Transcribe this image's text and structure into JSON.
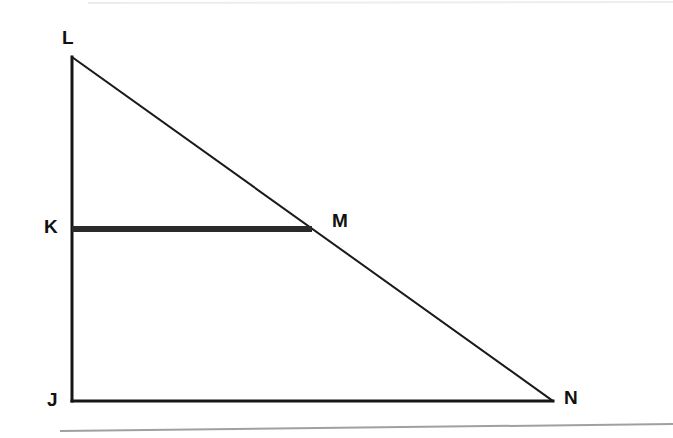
{
  "figure": {
    "type": "geometry-diagram",
    "shape": "right-triangle-with-parallel-segment",
    "background_color": "#ffffff",
    "stroke_color": "#161616",
    "labels": {
      "L": "L",
      "K": "K",
      "M": "M",
      "J": "J",
      "N": "N"
    },
    "points": {
      "L": {
        "x": 72,
        "y": 57
      },
      "K": {
        "x": 72,
        "y": 229
      },
      "M": {
        "x": 312,
        "y": 229
      },
      "J": {
        "x": 72,
        "y": 401
      },
      "N": {
        "x": 553,
        "y": 401
      }
    },
    "segments": [
      {
        "name": "JL",
        "from": "L",
        "to": "J",
        "width": 3,
        "emphasis": "normal"
      },
      {
        "name": "JN",
        "from": "J",
        "to": "N",
        "width": 3,
        "emphasis": "normal"
      },
      {
        "name": "LN",
        "from": "L",
        "to": "N",
        "width": 2,
        "emphasis": "thin"
      },
      {
        "name": "KM",
        "from": "K",
        "to": "M",
        "width": 6,
        "emphasis": "bold"
      }
    ],
    "scan_edges": [
      {
        "name": "top-edge",
        "y_left": 3,
        "y_right": 3,
        "color": "#e8e8e8"
      },
      {
        "name": "bottom-edge",
        "y_left": 430,
        "y_right": 424,
        "color": "#9a9a9e"
      }
    ]
  }
}
